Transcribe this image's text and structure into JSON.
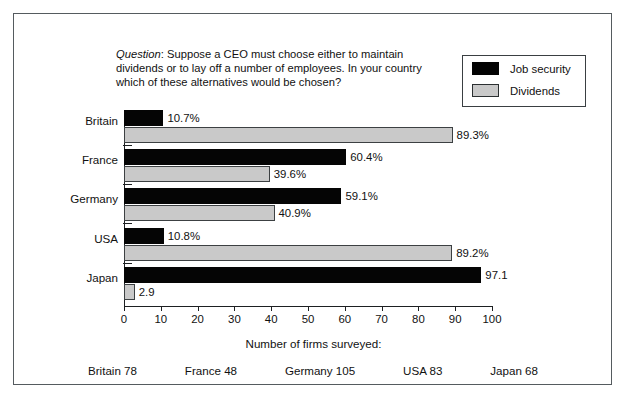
{
  "figure": {
    "question_prefix": "Question",
    "question_text": ": Suppose a CEO must choose either to maintain dividends or to lay off a number of employees. In your country which of these alternatives would be chosen?"
  },
  "legend": {
    "items": [
      {
        "label": "Job security",
        "color": "#050505",
        "swatch": "black"
      },
      {
        "label": "Dividends",
        "color": "#c9c9c9",
        "swatch": "gray"
      }
    ]
  },
  "footer": {
    "title": "Number of firms surveyed:",
    "counts": [
      "Britain 78",
      "France 48",
      "Germany 105",
      "USA 83",
      "Japan 68"
    ]
  },
  "chart_data": {
    "type": "bar",
    "orientation": "horizontal",
    "title": "",
    "xlabel": "",
    "ylabel": "",
    "xlim": [
      0,
      100
    ],
    "xticks": [
      0,
      10,
      20,
      30,
      40,
      50,
      60,
      70,
      80,
      90,
      100
    ],
    "xtick_labels": [
      "0",
      "10",
      "20",
      "30",
      "40",
      "50",
      "60",
      "70",
      "80",
      "90",
      "100"
    ],
    "grid": false,
    "legend_position": "top-right",
    "categories": [
      "Britain",
      "France",
      "Germany",
      "USA",
      "Japan"
    ],
    "series": [
      {
        "name": "Job security",
        "color": "#050505",
        "values": [
          10.7,
          60.4,
          59.1,
          10.8,
          97.1
        ],
        "labels": [
          "10.7%",
          "60.4%",
          "59.1%",
          "10.8%",
          "97.1"
        ]
      },
      {
        "name": "Dividends",
        "color": "#c9c9c9",
        "values": [
          89.3,
          39.6,
          40.9,
          89.2,
          2.9
        ],
        "labels": [
          "89.3%",
          "39.6%",
          "40.9%",
          "89.2%",
          "2.9"
        ]
      }
    ]
  }
}
